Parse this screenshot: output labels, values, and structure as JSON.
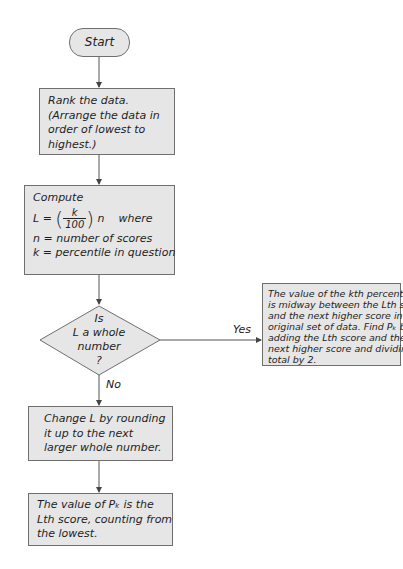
{
  "flowchart": {
    "start": {
      "label": "Start"
    },
    "rank": {
      "lines": [
        "Rank the data.",
        "(Arrange the data in",
        "order of lowest to",
        "highest.)"
      ]
    },
    "compute": {
      "title": "Compute",
      "formula_lhs": "L =",
      "frac_num": "k",
      "frac_den": "100",
      "formula_var": "n",
      "formula_where": "where",
      "def_n": "n = number of scores",
      "def_k": "k = percentile in question"
    },
    "decision": {
      "lines": [
        "Is",
        "L a whole",
        "number",
        "?"
      ]
    },
    "yes_label": "Yes",
    "no_label": "No",
    "yes_box": {
      "lines": [
        "The value of the kth percentile",
        "is midway between the Lth score",
        "and the next higher score in the",
        "original set of data. Find Pₖ by",
        "adding the Lth score and the",
        "next higher score and dividing the",
        "total by 2."
      ]
    },
    "change": {
      "lines": [
        "Change L by rounding",
        "it up to the next",
        "larger whole number."
      ]
    },
    "final": {
      "lines": [
        "The value of  Pₖ is the",
        "Lth score, counting from",
        "the lowest."
      ]
    },
    "colors": {
      "box_fill": "#e6e6e6",
      "box_border": "#6f6f6f",
      "line": "#555555"
    }
  }
}
